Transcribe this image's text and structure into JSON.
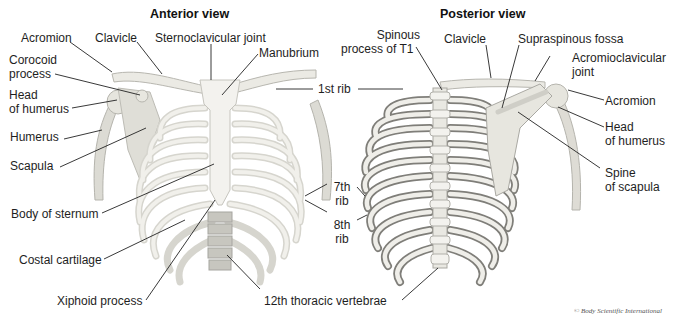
{
  "figure": {
    "panels": [
      {
        "id": "anterior",
        "title": "Anterior view"
      },
      {
        "id": "posterior",
        "title": "Posterior view"
      }
    ],
    "anterior_labels": {
      "acromion": "Acromion",
      "clavicle": "Clavicle",
      "sternoclavicular_joint": "Sternoclavicular joint",
      "manubrium": "Manubrium",
      "corocoid_process_1": "Corocoid",
      "corocoid_process_2": "process",
      "head_of_humerus_1": "Head",
      "head_of_humerus_2": "of humerus",
      "humerus": "Humerus",
      "scapula": "Scapula",
      "body_of_sternum": "Body of sternum",
      "costal_cartilage": "Costal cartilage",
      "xiphoid_process": "Xiphoid process"
    },
    "shared_labels": {
      "first_rib": "1st rib",
      "seventh_rib_1": "7th",
      "seventh_rib_2": "rib",
      "eighth_rib_1": "8th",
      "eighth_rib_2": "rib",
      "twelfth_thoracic_vertebrae": "12th thoracic vertebrae"
    },
    "posterior_labels": {
      "spinous_process_1": "Spinous",
      "spinous_process_2": "process of T1",
      "clavicle": "Clavicle",
      "supraspinous_fossa": "Supraspinous fossa",
      "acromioclavicular_joint_1": "Acromioclavicular",
      "acromioclavicular_joint_2": "joint",
      "acromion": "Acromion",
      "head_of_humerus_1": "Head",
      "head_of_humerus_2": "of humerus",
      "spine_of_scapula_1": "Spine",
      "spine_of_scapula_2": "of scapula"
    },
    "copyright": "© Body Scientific International",
    "colors": {
      "bone": "#e9e8e2",
      "bone_shade": "#bdbcb5",
      "bone_dark": "#7d7c78",
      "leader_line": "#222222"
    }
  }
}
